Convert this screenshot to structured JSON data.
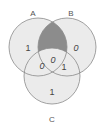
{
  "diagram": {
    "type": "venn-3",
    "sets": [
      {
        "id": "A",
        "label": "A"
      },
      {
        "id": "B",
        "label": "B"
      },
      {
        "id": "C",
        "label": "C"
      }
    ],
    "regions": {
      "A_only": "1",
      "B_only": "0",
      "C_only": "1",
      "A_and_B_only": "",
      "A_and_C_only": "0",
      "B_and_C_only": "1",
      "A_and_B_and_C": "0"
    },
    "shaded_region": "A_and_B_only",
    "colors": {
      "circle_fill": "#ebebeb",
      "circle_stroke": "#8a8a8a",
      "shaded_fill": "#8c8c8c",
      "background": "#ffffff"
    }
  }
}
